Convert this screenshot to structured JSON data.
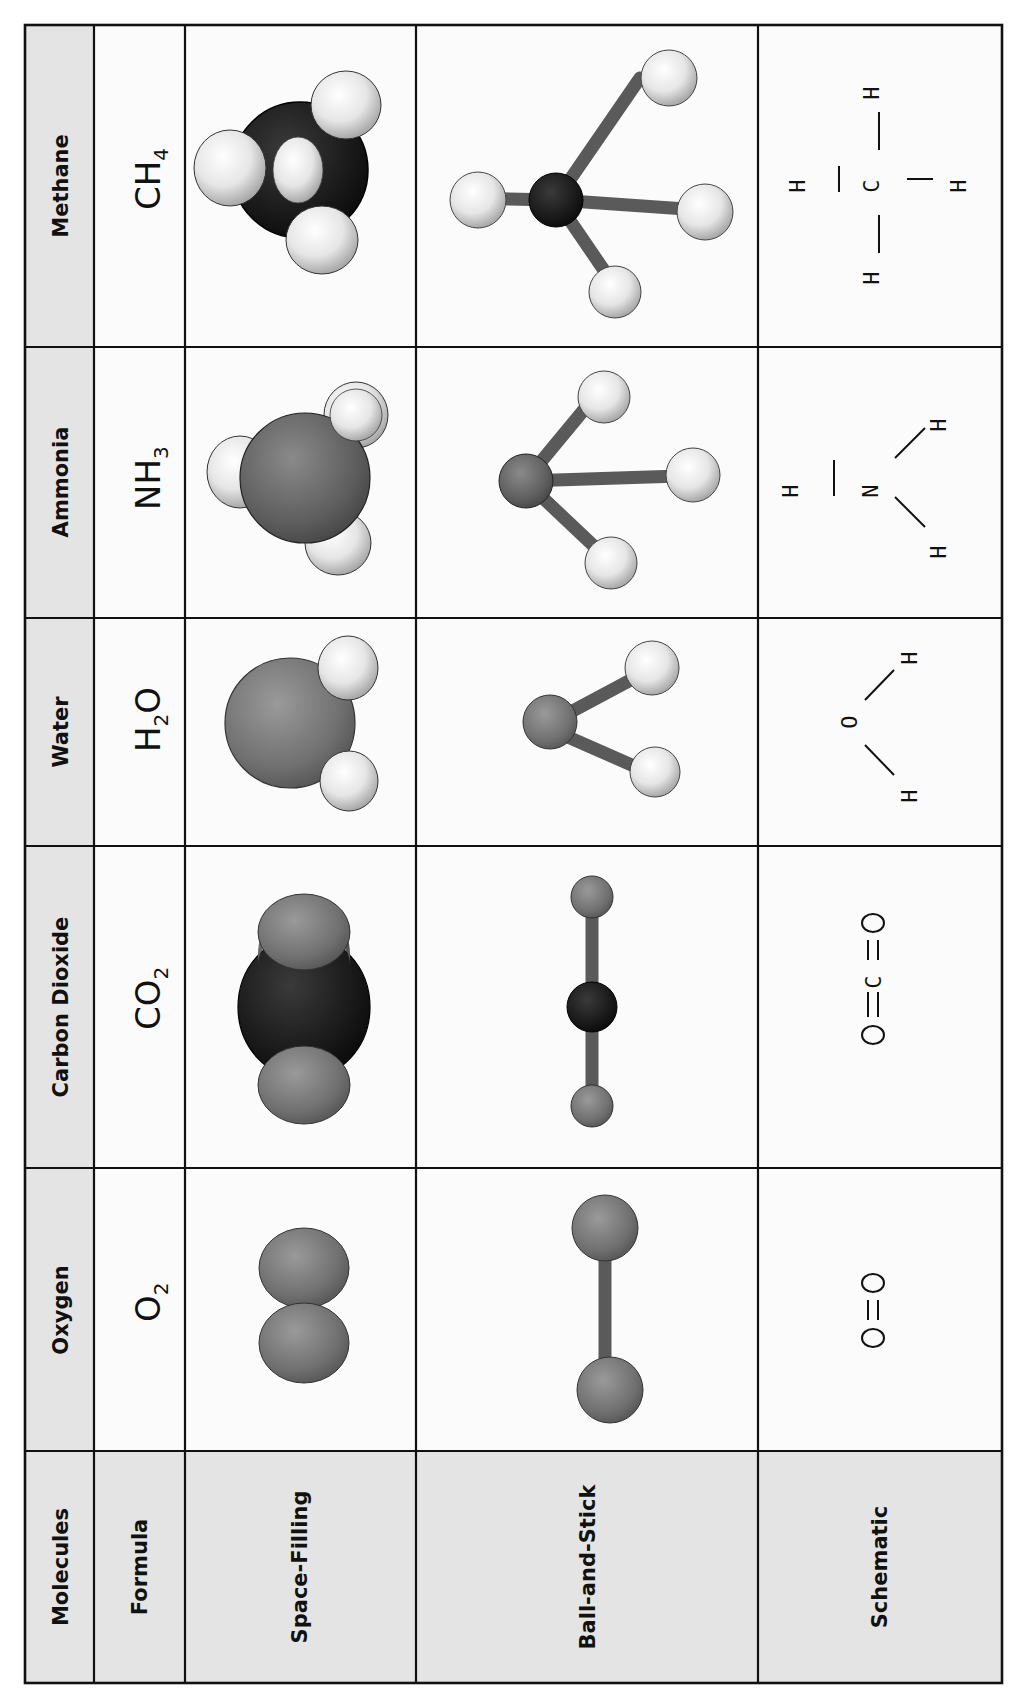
{
  "table": {
    "orientation": "rotated-90-ccw",
    "row_labels": {
      "header": "Molecules",
      "formula": "Formula",
      "space_filling": "Space-Filling",
      "ball_and_stick": "Ball-and-Stick",
      "schematic": "Schematic"
    },
    "molecules": [
      {
        "name": "Methane",
        "formula_main": "CH",
        "formula_sub": "4",
        "schematic": {
          "center": "C",
          "atoms": [
            "H",
            "H",
            "H",
            "H"
          ]
        }
      },
      {
        "name": "Ammonia",
        "formula_main": "NH",
        "formula_sub": "3",
        "schematic": {
          "center": "N",
          "atoms": [
            "H",
            "H",
            "H"
          ]
        }
      },
      {
        "name": "Water",
        "formula_main": "H",
        "formula_sub": "2",
        "formula_tail": "O",
        "schematic": {
          "center": "O",
          "atoms": [
            "H",
            "H"
          ]
        }
      },
      {
        "name": "Carbon Dioxide",
        "formula_main": "CO",
        "formula_sub": "2",
        "schematic": {
          "text": "O=C=O",
          "atoms": [
            "O",
            "C",
            "O"
          ]
        }
      },
      {
        "name": "Oxygen",
        "formula_main": "O",
        "formula_sub": "2",
        "schematic": {
          "text": "O=O",
          "atoms": [
            "O",
            "O"
          ]
        }
      }
    ]
  },
  "colors": {
    "grid_line": "#111111",
    "header_fill": "#e4e4e4",
    "cell_fill": "#fbfbfb",
    "carbon": "#151515",
    "oxygen_nitrogen": "#6e6e6e",
    "hydrogen": "#ececec",
    "bond": "#5a5a5a"
  }
}
